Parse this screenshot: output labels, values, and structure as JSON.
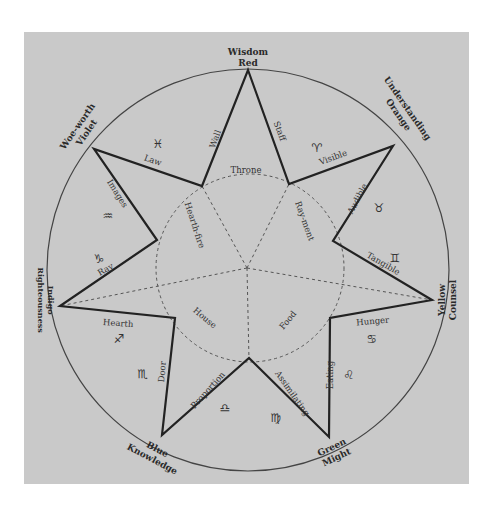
{
  "diagram": {
    "points": [
      {
        "id": "top",
        "line1": "Wisdom",
        "line2": "Red"
      },
      {
        "id": "upper-right",
        "line1": "Understanding",
        "line2": "Orange"
      },
      {
        "id": "right",
        "line1": "Yellow",
        "line2": "Counsel"
      },
      {
        "id": "lower-right",
        "line1": "Green",
        "line2": "Might"
      },
      {
        "id": "lower-left",
        "line1": "Blue",
        "line2": "Knowledge"
      },
      {
        "id": "left",
        "line1": "Indigo",
        "line2": "Righteousness"
      },
      {
        "id": "upper-left",
        "line1": "Woe-worth",
        "line2": "Violet"
      }
    ],
    "edges": {
      "wall": "Wall",
      "staff": "Staff",
      "visible": "Visible",
      "audible": "Audible",
      "tangible": "Tangible",
      "hunger": "Hunger",
      "eating": "Eating",
      "assimilating": "Assimilating",
      "proportion": "Proportion",
      "door": "Door",
      "hearth": "Hearth",
      "ray": "Ray",
      "images": "Images",
      "law": "Law"
    },
    "inner": {
      "throne": "Throne",
      "raiment": "Ray-ment",
      "food": "Food",
      "house": "House",
      "hearthfire": "Hearth-fire"
    },
    "zodiac": {
      "aries": "♈",
      "taurus": "♉",
      "gemini": "♊",
      "cancer": "♋",
      "leo": "♌",
      "virgo": "♍",
      "libra": "♎",
      "scorpio": "♏",
      "sagittarius": "♐",
      "capricorn": "♑",
      "aquarius": "♒",
      "pisces": "♓"
    },
    "colors": {
      "background": "#c9c9c9",
      "ink": "#2a2a2a"
    }
  }
}
